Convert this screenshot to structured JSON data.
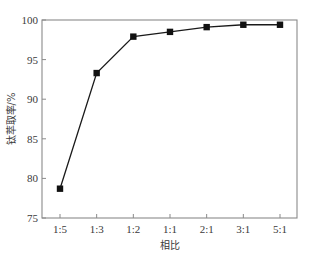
{
  "chart_data": {
    "type": "line",
    "title": "",
    "xlabel": "相比",
    "ylabel": "钛萃取率/%",
    "categories": [
      "1:5",
      "1:3",
      "1:2",
      "1:1",
      "2:1",
      "3:1",
      "5:1"
    ],
    "series": [
      {
        "name": "钛萃取率",
        "values": [
          78.7,
          93.3,
          97.9,
          98.5,
          99.1,
          99.4,
          99.4
        ],
        "marker": "square",
        "color": "#111111"
      }
    ],
    "ylim": [
      75,
      100
    ],
    "yticks": [
      75,
      80,
      85,
      90,
      95,
      100
    ],
    "grid": false,
    "legend": null
  },
  "style": {
    "axis_color": "#8a8a8a",
    "line_color": "#1a1a1a",
    "marker_color": "#111111",
    "text_color": "#3a3a3a"
  }
}
